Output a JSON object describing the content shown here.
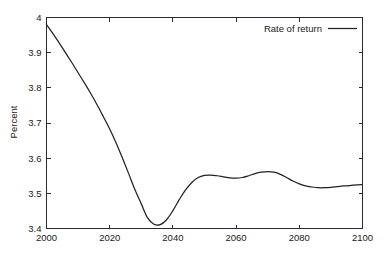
{
  "chart_data": {
    "type": "line",
    "title": "",
    "xlabel": "",
    "ylabel": "Percent",
    "xlim": [
      2000,
      2100
    ],
    "ylim": [
      3.4,
      4.0
    ],
    "grid": false,
    "legend_position": "top-right",
    "x_ticks": [
      2000,
      2020,
      2040,
      2060,
      2080,
      2100
    ],
    "x_tick_labels": [
      "2000",
      "2020",
      "2040",
      "2060",
      "2080",
      "2100"
    ],
    "y_ticks": [
      3.4,
      3.5,
      3.6,
      3.7,
      3.8,
      3.9,
      4.0
    ],
    "y_tick_labels": [
      "3.4",
      "3.5",
      "3.6",
      "3.7",
      "3.8",
      "3.9",
      "4"
    ],
    "series": [
      {
        "name": "Rate of return",
        "color": "#222222",
        "x": [
          2000,
          2002,
          2004,
          2006,
          2008,
          2010,
          2012,
          2014,
          2016,
          2018,
          2020,
          2022,
          2024,
          2026,
          2028,
          2030,
          2032,
          2034,
          2036,
          2038,
          2040,
          2042,
          2044,
          2046,
          2048,
          2050,
          2052,
          2054,
          2056,
          2058,
          2060,
          2062,
          2064,
          2066,
          2068,
          2070,
          2072,
          2074,
          2076,
          2078,
          2080,
          2082,
          2084,
          2086,
          2088,
          2090,
          2092,
          2094,
          2096,
          2098,
          2100
        ],
        "values": [
          3.98,
          3.955,
          3.928,
          3.9,
          3.872,
          3.843,
          3.814,
          3.784,
          3.752,
          3.718,
          3.683,
          3.644,
          3.601,
          3.556,
          3.51,
          3.47,
          3.43,
          3.412,
          3.411,
          3.425,
          3.451,
          3.482,
          3.51,
          3.531,
          3.545,
          3.551,
          3.552,
          3.55,
          3.547,
          3.544,
          3.543,
          3.545,
          3.55,
          3.556,
          3.56,
          3.562,
          3.56,
          3.554,
          3.545,
          3.535,
          3.527,
          3.521,
          3.518,
          3.516,
          3.516,
          3.517,
          3.519,
          3.521,
          3.522,
          3.524,
          3.525
        ]
      }
    ]
  },
  "legend": {
    "entries": [
      {
        "label": "Rate of return"
      }
    ]
  }
}
